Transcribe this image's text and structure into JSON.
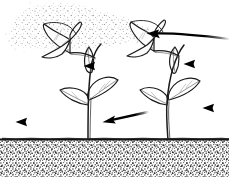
{
  "figure": {
    "title": "Seedlings being sprayed, arrows indicating spray direction",
    "width": 229,
    "height": 177,
    "background_color": "#ffffff",
    "ink_color": "#000000",
    "style": "black and white line drawing with stipple shading"
  },
  "scene": {
    "sky": {
      "label": "sky area",
      "color": "#ffffff"
    },
    "spray_cloud": {
      "label": "spray droplet cloud",
      "description": "fine stippled mist drifting from upper left across the top",
      "dot_color": "#9a9a9a",
      "extent": {
        "x": 4,
        "y": 2,
        "width": 150,
        "height": 48
      }
    },
    "ground_line": {
      "label": "soil surface line",
      "color": "#1a1a1a",
      "y": 139
    },
    "soil": {
      "label": "stippled soil band",
      "dot_color": "#555555",
      "background": "#ffffff",
      "extent": {
        "x": 0,
        "y": 140,
        "width": 229,
        "height": 37
      }
    }
  },
  "plants": [
    {
      "name": "left-seedling",
      "label": "Left seedling",
      "stem_base_x": 88,
      "stem_base_y": 140,
      "top_leaf": "drooping curled leaf at top, angled left",
      "leaf_count": 5
    },
    {
      "name": "right-seedling",
      "label": "Right seedling",
      "stem_base_x": 168,
      "stem_base_y": 140,
      "top_leaf": "drooping curled leaf at top, angled left",
      "leaf_count": 5
    }
  ],
  "arrows": [
    {
      "name": "arrow-top-right",
      "label": "Arrow pointing left at right plant top leaf",
      "direction": "left",
      "shape": "slightly curved",
      "tip": {
        "x": 148,
        "y": 34
      },
      "tail": {
        "x": 229,
        "y": 39
      }
    },
    {
      "name": "arrow-mid-right",
      "label": "Arrow pointing left at right plant upper leaf",
      "direction": "left",
      "shape": "straight",
      "tip": {
        "x": 184,
        "y": 64
      },
      "tail": {
        "x": 229,
        "y": 64
      }
    },
    {
      "name": "arrow-lower-right",
      "label": "Arrow pointing left at right plant lower leaf",
      "direction": "left",
      "shape": "straight",
      "tip": {
        "x": 202,
        "y": 108
      },
      "tail": {
        "x": 229,
        "y": 108
      }
    },
    {
      "name": "arrow-mid-left",
      "label": "Arrow pointing left at left plant upper leaf",
      "direction": "left",
      "shape": "straight",
      "tip": {
        "x": 84,
        "y": 66
      },
      "tail": {
        "x": 120,
        "y": 66
      }
    },
    {
      "name": "arrow-lower-center",
      "label": "Slanted arrow pointing down-left toward left plant base",
      "direction": "down-left",
      "shape": "straight slanted",
      "tip": {
        "x": 103,
        "y": 122
      },
      "tail": {
        "x": 148,
        "y": 113
      }
    },
    {
      "name": "arrow-lower-left",
      "label": "Arrow pointing left at far left",
      "direction": "left",
      "shape": "straight",
      "tip": {
        "x": 16,
        "y": 122
      },
      "tail": {
        "x": 62,
        "y": 122
      }
    }
  ]
}
